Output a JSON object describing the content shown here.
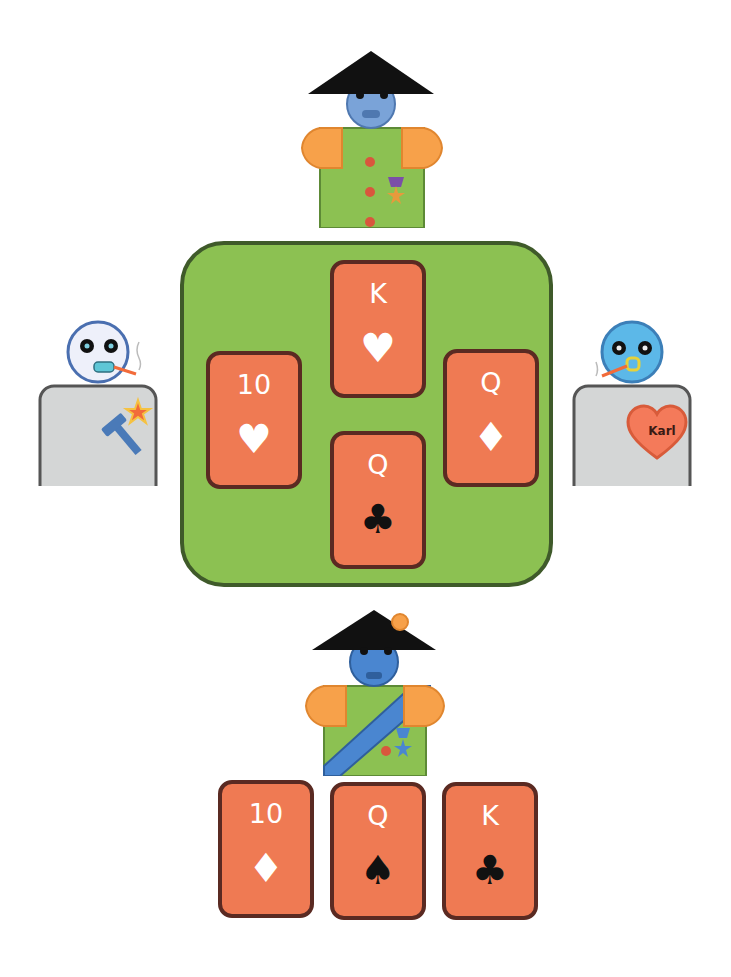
{
  "players": {
    "top": {
      "role": "opponent",
      "badges": [
        "buttons",
        "medal-star"
      ]
    },
    "left": {
      "role": "opponent",
      "badges": [
        "hammer",
        "star"
      ]
    },
    "right": {
      "role": "opponent",
      "badge_text": "Karl"
    },
    "bottom": {
      "role": "self",
      "badges": [
        "sash",
        "medal-star",
        "hat-flower"
      ]
    }
  },
  "trick": [
    {
      "position": "top",
      "rank": "K",
      "suit": "♥",
      "suit_name": "hearts",
      "color": "red"
    },
    {
      "position": "left",
      "rank": "10",
      "suit": "♥",
      "suit_name": "hearts",
      "color": "red"
    },
    {
      "position": "right",
      "rank": "Q",
      "suit": "♦",
      "suit_name": "diamonds",
      "color": "red"
    },
    {
      "position": "bottom",
      "rank": "Q",
      "suit": "♣",
      "suit_name": "clubs",
      "color": "black"
    }
  ],
  "hand": [
    {
      "rank": "10",
      "suit": "♦",
      "suit_name": "diamonds",
      "color": "red"
    },
    {
      "rank": "Q",
      "suit": "♠",
      "suit_name": "spades",
      "color": "black"
    },
    {
      "rank": "K",
      "suit": "♣",
      "suit_name": "clubs",
      "color": "black"
    }
  ],
  "colors": {
    "table": "#8cc152",
    "table_border": "#3f5a2a",
    "card": "#ef7a53",
    "card_border": "#5a2a22",
    "skin_blue": "#5b8fd6",
    "shirt_green": "#8cc152",
    "sleeve_orange": "#f7a14a",
    "body_grey": "#d4d6d6"
  }
}
